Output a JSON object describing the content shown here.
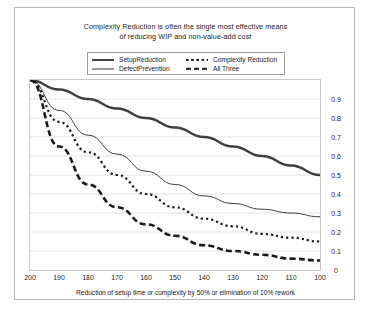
{
  "chart_data": {
    "type": "line",
    "title": "Complexity Reduction is often the single most effective means of reducing WIP and non-value-add cost",
    "title_lines": [
      "Complexity Reduction is often the single most effective means",
      "of reducing WIP and non-value-add cost"
    ],
    "xlabel": "Reduction of setup time or complexity by 50% or elimination of 10% rework",
    "ylabel": "",
    "x": [
      200,
      190,
      180,
      170,
      160,
      150,
      140,
      130,
      120,
      110,
      100
    ],
    "xticklabels": [
      "200",
      "190",
      "180",
      "170",
      "160",
      "150",
      "140",
      "130",
      "120",
      "110",
      "100"
    ],
    "yticklabels": [
      "0.9",
      "0.8",
      "0.7",
      "0.6",
      "0.5",
      "0.4",
      "0.3",
      "0.2",
      "0.1",
      "0"
    ],
    "yticks": [
      0.9,
      0.8,
      0.7,
      0.6,
      0.5,
      0.4,
      0.3,
      0.2,
      0.1,
      0
    ],
    "xlim": [
      200,
      100
    ],
    "ylim": [
      0,
      1.0
    ],
    "x_axis_inverted": true,
    "grid": true,
    "grid_color": "#d9d9d9",
    "legend_position": "top-center",
    "series": [
      {
        "name": "SetupReduction",
        "style": "solid-thick",
        "color": "#3f3f3f",
        "values": [
          1.0,
          0.95,
          0.9,
          0.85,
          0.8,
          0.75,
          0.7,
          0.65,
          0.6,
          0.55,
          0.5
        ]
      },
      {
        "name": "DefectPrevention",
        "style": "solid-thin",
        "color": "#3f3f3f",
        "values": [
          1.0,
          0.84,
          0.71,
          0.61,
          0.52,
          0.45,
          0.39,
          0.35,
          0.32,
          0.3,
          0.28
        ]
      },
      {
        "name": "Complexity Reduction",
        "style": "dotted",
        "color": "#1a1a1a",
        "values": [
          1.0,
          0.78,
          0.62,
          0.5,
          0.4,
          0.33,
          0.27,
          0.23,
          0.19,
          0.17,
          0.15
        ]
      },
      {
        "name": "All Three",
        "style": "dashed-thick",
        "color": "#1a1a1a",
        "values": [
          1.0,
          0.65,
          0.45,
          0.33,
          0.24,
          0.18,
          0.13,
          0.1,
          0.08,
          0.06,
          0.05
        ]
      }
    ]
  },
  "legend": {
    "entries": [
      {
        "label": "SetupReduction",
        "style": "solid-thick"
      },
      {
        "label": "Complexity Reduction",
        "style": "dotted"
      },
      {
        "label": "DefectPrevention",
        "style": "solid-thin"
      },
      {
        "label": "All Three",
        "style": "dashed-thick"
      }
    ]
  }
}
